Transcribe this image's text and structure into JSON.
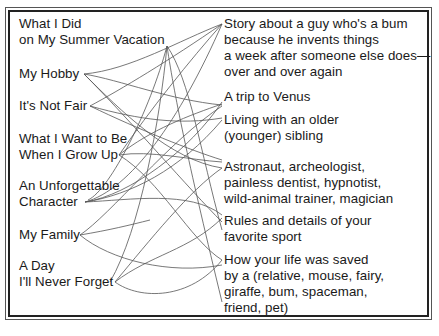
{
  "title_topics": [
    {
      "lines": [
        "What I Did",
        "on My Summer Vacation"
      ]
    },
    {
      "lines": [
        "My Hobby"
      ]
    },
    {
      "lines": [
        "It's Not Fair"
      ]
    },
    {
      "lines": [
        "What I Want to Be",
        "When I Grow Up"
      ]
    },
    {
      "lines": [
        "An Unforgettable",
        "Character"
      ]
    },
    {
      "lines": [
        "My Family"
      ]
    },
    {
      "lines": [
        "A Day",
        "I'll Never Forget"
      ]
    }
  ],
  "story_ideas": [
    {
      "lines": [
        "Story about a guy who's a bum",
        "because he invents things",
        "a week after someone else does—",
        "over and over again"
      ]
    },
    {
      "lines": [
        "A trip to Venus"
      ]
    },
    {
      "lines": [
        "Living with an older",
        "(younger) sibling"
      ]
    },
    {
      "lines": [
        "Astronaut, archeologist,",
        "painless dentist, hypnotist,",
        "wild-animal trainer, magician"
      ]
    },
    {
      "lines": [
        "Rules and details of your",
        "favorite sport"
      ]
    },
    {
      "lines": [
        "How your life was saved",
        "by a (relative, mouse, fairy,",
        "giraffe, bum, spaceman,",
        "friend, pet)"
      ]
    }
  ],
  "colors": {
    "text": "#1a1a1a",
    "connector": "#555555",
    "border": "#222222",
    "background": "#ffffff"
  }
}
